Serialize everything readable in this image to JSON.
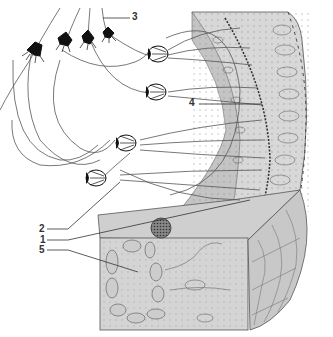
{
  "diagram": {
    "type": "anatomical-illustration",
    "colors": {
      "tissue_fill": "#d6d6d6",
      "tissue_dark": "#b8b8b8",
      "line": "#444444",
      "ink": "#111111",
      "background": "#ffffff"
    },
    "labels": [
      {
        "id": "1",
        "text": "1"
      },
      {
        "id": "2",
        "text": "2"
      },
      {
        "id": "3",
        "text": "3"
      },
      {
        "id": "4",
        "text": "4"
      },
      {
        "id": "5",
        "text": "5"
      }
    ]
  }
}
